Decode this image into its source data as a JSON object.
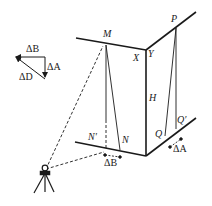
{
  "diagram": {
    "title": "",
    "labels": {
      "M": "M",
      "X": "X",
      "Y": "Y",
      "P": "P",
      "H": "H",
      "N_prime": "N′",
      "N": "N",
      "Q": "Q",
      "Q_prime": "Q′",
      "delta_B_bottom": "ΔB",
      "delta_A_bottom": "ΔA",
      "legend_delta_B": "ΔB",
      "legend_delta_A": "ΔA",
      "legend_delta_D": "ΔD"
    },
    "icons": [
      "theodolite-tripod-icon"
    ],
    "colors": {
      "ink": "#1a1a1a",
      "background": "#ffffff"
    }
  }
}
